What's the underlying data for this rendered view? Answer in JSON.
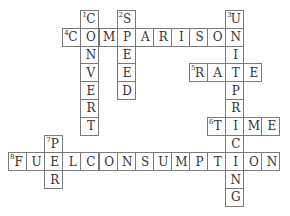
{
  "puzzle": {
    "type": "crossword",
    "grid": {
      "origin_x": 8,
      "origin_y": 10,
      "cell_w": 18.1,
      "cell_h": 17.8
    },
    "words": [
      {
        "number": 1,
        "direction": "down",
        "answer": "CONVERT",
        "row": 0,
        "col": 4
      },
      {
        "number": 2,
        "direction": "down",
        "answer": "SPEED",
        "row": 0,
        "col": 6
      },
      {
        "number": 3,
        "direction": "down",
        "answer": "UNITPRICING",
        "row": 0,
        "col": 12
      },
      {
        "number": 4,
        "direction": "across",
        "answer": "COMPARISON",
        "row": 1,
        "col": 3
      },
      {
        "number": 5,
        "direction": "across",
        "answer": "RATE",
        "row": 3,
        "col": 10
      },
      {
        "number": 6,
        "direction": "across",
        "answer": "TIME",
        "row": 6,
        "col": 11
      },
      {
        "number": 7,
        "direction": "down",
        "answer": "PER",
        "row": 7,
        "col": 2
      },
      {
        "number": 8,
        "direction": "across",
        "answer": "FUELCONSUMPTION",
        "row": 8,
        "col": 0
      }
    ],
    "colors": {
      "border": "#7a7a7a",
      "text": "#333333",
      "background": "#ffffff"
    }
  }
}
